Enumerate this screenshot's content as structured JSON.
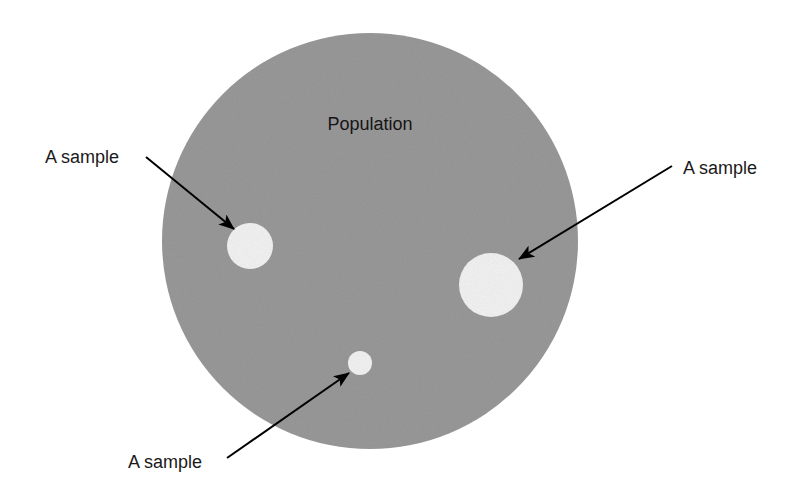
{
  "figure": {
    "background_color": "#ffffff",
    "width": 804,
    "height": 493
  },
  "population": {
    "label": "Population",
    "fill_color": "#999999",
    "center": {
      "x": 370,
      "y": 241
    },
    "radius": 208,
    "label_position": {
      "x": 370,
      "y": 130
    }
  },
  "samples": [
    {
      "id": "sample-left",
      "label": "A sample",
      "fill_color": "#f2f2f2",
      "center": {
        "x": 250,
        "y": 246
      },
      "radius": 23,
      "label_position": {
        "x": 45,
        "y": 163
      },
      "arrow": {
        "from": {
          "x": 146,
          "y": 157
        },
        "to": {
          "x": 234,
          "y": 229
        }
      }
    },
    {
      "id": "sample-right",
      "label": "A sample",
      "fill_color": "#f2f2f2",
      "center": {
        "x": 491,
        "y": 285
      },
      "radius": 32,
      "label_position": {
        "x": 683,
        "y": 174
      },
      "arrow": {
        "from": {
          "x": 672,
          "y": 166
        },
        "to": {
          "x": 519,
          "y": 259
        }
      }
    },
    {
      "id": "sample-bottom",
      "label": "A sample",
      "fill_color": "#f2f2f2",
      "center": {
        "x": 360,
        "y": 363
      },
      "radius": 12,
      "label_position": {
        "x": 128,
        "y": 468
      },
      "arrow": {
        "from": {
          "x": 227,
          "y": 458
        },
        "to": {
          "x": 349,
          "y": 373
        }
      }
    }
  ],
  "arrow_style": {
    "color": "#000000",
    "line_width": 2
  }
}
